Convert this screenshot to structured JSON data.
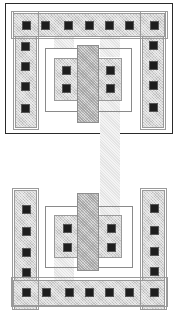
{
  "diagram": {
    "type": "cmos-layout",
    "colors": {
      "outline": "#2a2a2a",
      "diffusion": "#d6d6d6",
      "poly": "#c4c4c4",
      "strip": "#e4e4e4",
      "contact": "#1e1e1e",
      "well_line": "#8a8a8a"
    },
    "top_cell": {
      "outer_box": {
        "x": 5,
        "y": 3,
        "w": 168,
        "h": 131
      },
      "substrate_bar": {
        "x": 13,
        "y": 13,
        "w": 152,
        "h": 24
      },
      "left_rail": {
        "x": 15,
        "y": 13,
        "w": 22,
        "h": 115
      },
      "right_rail": {
        "x": 142,
        "y": 13,
        "w": 22,
        "h": 115
      },
      "well_box": {
        "x": 45,
        "y": 48,
        "w": 87,
        "h": 64
      },
      "active": {
        "x": 54,
        "y": 58,
        "w": 68,
        "h": 43
      },
      "gate": {
        "x": 77,
        "y": 45,
        "w": 22,
        "h": 78
      },
      "bar_contacts_x": [
        22,
        41,
        64,
        85,
        105,
        125,
        150
      ],
      "bar_contacts_y": 21,
      "left_rail_contacts_y": [
        42,
        62,
        82,
        104
      ],
      "left_rail_contacts_x": 21,
      "right_rail_contacts_y": [
        41,
        61,
        81,
        103
      ],
      "right_rail_contacts_x": 149,
      "device_contacts": [
        {
          "x": 62,
          "y": 66
        },
        {
          "x": 62,
          "y": 84
        },
        {
          "x": 106,
          "y": 66
        },
        {
          "x": 106,
          "y": 84
        }
      ]
    },
    "connector": {
      "x": 100,
      "y": 100,
      "w": 20,
      "h": 137
    },
    "bottom_cell": {
      "left_rail": {
        "x": 14,
        "y": 190,
        "w": 23,
        "h": 120
      },
      "right_rail": {
        "x": 142,
        "y": 190,
        "w": 23,
        "h": 120
      },
      "well_box": {
        "x": 45,
        "y": 206,
        "w": 88,
        "h": 62
      },
      "active": {
        "x": 54,
        "y": 215,
        "w": 68,
        "h": 43
      },
      "gate": {
        "x": 77,
        "y": 193,
        "w": 22,
        "h": 78
      },
      "substrate_bar": {
        "x": 13,
        "y": 280,
        "w": 152,
        "h": 26
      },
      "bar_contacts_x": [
        22,
        42,
        65,
        85,
        105,
        125,
        150
      ],
      "bar_contacts_y": 288,
      "left_rail_contacts_y": [
        205,
        227,
        248,
        268
      ],
      "left_rail_contacts_x": 22,
      "right_rail_contacts_y": [
        204,
        226,
        247,
        267
      ],
      "right_rail_contacts_x": 150,
      "device_contacts": [
        {
          "x": 63,
          "y": 224
        },
        {
          "x": 63,
          "y": 243
        },
        {
          "x": 107,
          "y": 224
        },
        {
          "x": 107,
          "y": 243
        }
      ]
    }
  }
}
